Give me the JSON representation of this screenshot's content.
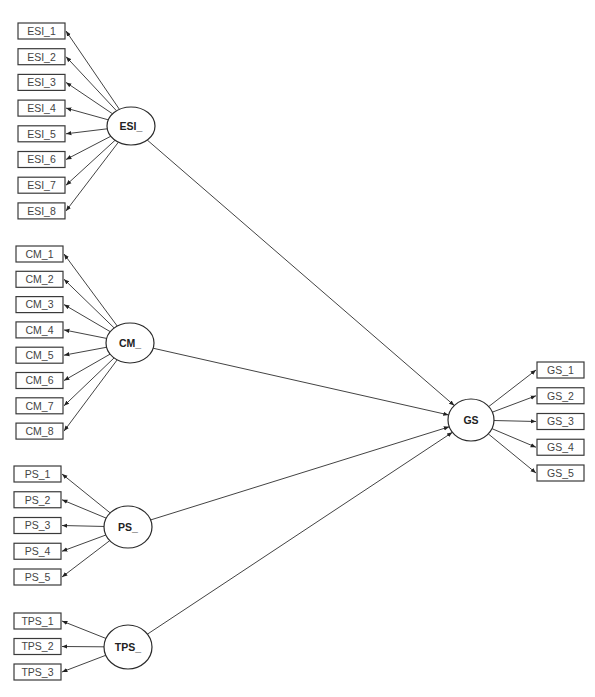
{
  "diagram": {
    "type": "structural-equation-model",
    "latents": [
      {
        "id": "ESI_",
        "label": "ESI_",
        "indicators": [
          "ESI_1",
          "ESI_2",
          "ESI_3",
          "ESI_4",
          "ESI_5",
          "ESI_6",
          "ESI_7",
          "ESI_8"
        ]
      },
      {
        "id": "CM_",
        "label": "CM_",
        "indicators": [
          "CM_1",
          "CM_2",
          "CM_3",
          "CM_4",
          "CM_5",
          "CM_6",
          "CM_7",
          "CM_8"
        ]
      },
      {
        "id": "PS_",
        "label": "PS_",
        "indicators": [
          "PS_1",
          "PS_2",
          "PS_3",
          "PS_4",
          "PS_5"
        ]
      },
      {
        "id": "TPS_",
        "label": "TPS_",
        "indicators": [
          "TPS_1",
          "TPS_2",
          "TPS_3"
        ]
      }
    ],
    "outcome": {
      "id": "GS",
      "label": "GS",
      "indicators": [
        "GS_1",
        "GS_2",
        "GS_3",
        "GS_4",
        "GS_5"
      ]
    },
    "paths": [
      {
        "from": "ESI_",
        "to": "GS"
      },
      {
        "from": "CM_",
        "to": "GS"
      },
      {
        "from": "PS_",
        "to": "GS"
      },
      {
        "from": "TPS_",
        "to": "GS"
      }
    ]
  }
}
